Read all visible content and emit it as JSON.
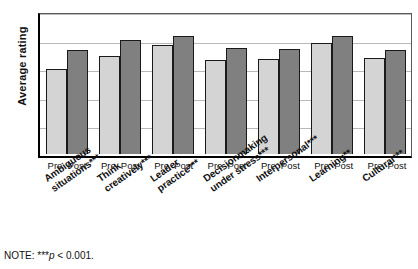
{
  "chart_data": {
    "type": "bar",
    "title": "",
    "xlabel": "",
    "ylabel": "Average rating",
    "ylim": [
      1,
      6
    ],
    "yticks": [
      "6",
      "5",
      "4",
      "3",
      "2",
      "1"
    ],
    "grid": true,
    "legend_position": "none",
    "categories": [
      "Ambiguous\nsituations***",
      "Think\ncreatively***",
      "Leader\npractice***",
      "Decisionmaking\nunder stress***",
      "Interpersonal***",
      "Learning**",
      "Cultural***"
    ],
    "group_tick_labels": [
      "Pre",
      "Post"
    ],
    "series": [
      {
        "name": "Pre",
        "values": [
          3.97,
          4.42,
          4.82,
          4.3,
          4.33,
          4.88,
          4.35
        ]
      },
      {
        "name": "Post",
        "values": [
          4.62,
          4.98,
          5.13,
          4.7,
          4.68,
          5.12,
          4.65
        ]
      }
    ],
    "colors": {
      "pre": "#d4d4d4",
      "post": "#808080",
      "axis": "#000000",
      "grid": "#b9b9b9"
    }
  },
  "note": {
    "prefix": "NOTE: ***",
    "italic": "p",
    "suffix": " < 0.001."
  }
}
